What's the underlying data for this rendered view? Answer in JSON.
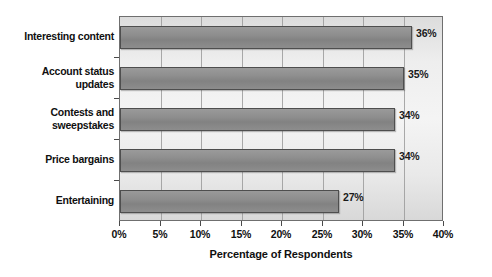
{
  "chart_data": {
    "type": "bar",
    "orientation": "horizontal",
    "title": "",
    "xlabel": "Percentage of Respondents",
    "ylabel": "",
    "categories": [
      "Interesting content",
      "Account status updates",
      "Contests and sweepstakes",
      "Price bargains",
      "Entertaining"
    ],
    "values": [
      36,
      35,
      34,
      34,
      27
    ],
    "data_labels": [
      "36%",
      "35%",
      "34%",
      "34%",
      "27%"
    ],
    "xlim": [
      0,
      40
    ],
    "xticks": [
      0,
      5,
      10,
      15,
      20,
      25,
      30,
      35,
      40
    ],
    "xtick_labels": [
      "0%",
      "5%",
      "10%",
      "15%",
      "20%",
      "25%",
      "30%",
      "35%",
      "40%"
    ],
    "grid": "vertical",
    "legend": "none",
    "bar_color": "#8b8b8b",
    "bar_border_color": "#4e4e4e",
    "plot_background": "#ececec",
    "page_background": "#ffffff",
    "text_color": "#101010"
  },
  "category_lines": [
    [
      "Interesting content"
    ],
    [
      "Account status",
      "updates"
    ],
    [
      "Contests and",
      "sweepstakes"
    ],
    [
      "Price bargains"
    ],
    [
      "Entertaining"
    ]
  ]
}
